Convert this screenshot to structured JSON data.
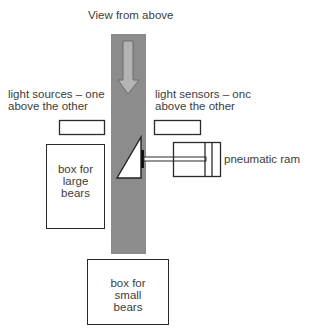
{
  "title": "View from above",
  "labels": {
    "light_sources": [
      "light sources – one",
      "above the other"
    ],
    "light_sensors": [
      "light sensors – onc",
      "above the other"
    ],
    "pneumatic_ram": "pneumatic ram"
  },
  "boxes": {
    "large_bears": [
      "box for",
      "large",
      "bears"
    ],
    "small_bears": [
      "box for",
      "small",
      "bears"
    ]
  },
  "colors": {
    "conveyor": "#8c8c8c",
    "arrow_fill": "#b4b4b4",
    "arrow_stroke": "#6a6a6a",
    "outline": "#2a2a2a"
  }
}
